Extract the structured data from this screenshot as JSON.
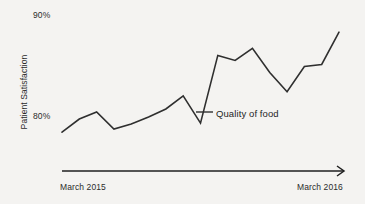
{
  "chart_data": {
    "type": "line",
    "title": "",
    "xlabel": "",
    "ylabel": "Patient Satisfaction",
    "ytick_labels": [
      "90%",
      "80%"
    ],
    "ytick_values": [
      90,
      80
    ],
    "xtick_labels": [
      "March 2015",
      "March 2016"
    ],
    "ylim": [
      77.0,
      91.0
    ],
    "grid": false,
    "legend": "none",
    "annotations": [
      {
        "text": "Quality of food",
        "points_to_series": "Quality of food",
        "leader_line": true
      }
    ],
    "series": [
      {
        "name": "Quality of food",
        "color": "#2f2f2f",
        "x": [
          "March 2015",
          "Apr 2015",
          "May 2015",
          "Jun 2015",
          "Jul 2015",
          "Aug 2015",
          "Sep 2015",
          "Oct 2015",
          "Nov 2015",
          "Dec 2015",
          "Jan 2016",
          "Feb 2016",
          "Mar 2016",
          "Apr 2016",
          "May 2016",
          "Jun 2016",
          "March 2016"
        ],
        "values": [
          78.3,
          79.6,
          80.3,
          78.6,
          79.1,
          79.8,
          80.6,
          81.9,
          79.2,
          85.9,
          85.4,
          86.6,
          84.2,
          82.3,
          84.8,
          85.0,
          88.2
        ]
      }
    ],
    "axis_style": {
      "x_axis_arrow": true,
      "y_axis_visible": false,
      "line_width": 1.6,
      "background": "#f4f3f1",
      "ink": "#2f2f2f"
    }
  },
  "colors": {
    "background": "#f4f3f1",
    "line": "#2f2f2f",
    "axis": "#1f1f1f",
    "text": "#2b2b2b"
  }
}
